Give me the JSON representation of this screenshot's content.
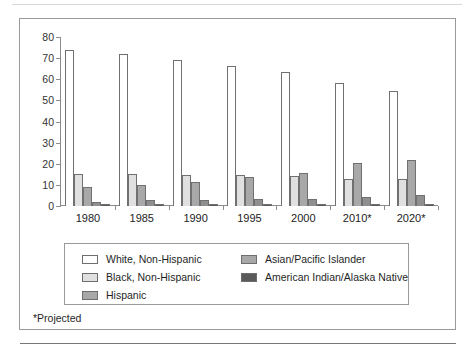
{
  "figure": {
    "footnote": "*Projected"
  },
  "chart_data": {
    "type": "bar",
    "title": "",
    "xlabel": "",
    "ylabel": "",
    "ylim": [
      0,
      80
    ],
    "yticks": [
      0,
      10,
      20,
      30,
      40,
      50,
      60,
      70,
      80
    ],
    "ytick_labels": [
      "0",
      "10",
      "20",
      "30",
      "40",
      "50",
      "60",
      "70",
      "80"
    ],
    "grid": false,
    "legend_position": "below-axes",
    "categories": [
      "1980",
      "1985",
      "1990",
      "1995",
      "2000",
      "2010*",
      "2020*"
    ],
    "series": [
      {
        "name": "White, Non-Hispanic",
        "color": "#ffffff",
        "values": [
          74.0,
          72.0,
          69.0,
          66.5,
          63.5,
          58.0,
          54.5
        ]
      },
      {
        "name": "Black, Non-Hispanic",
        "color": "#e0e0e0",
        "values": [
          15.0,
          15.0,
          14.5,
          14.5,
          14.0,
          13.0,
          13.0
        ]
      },
      {
        "name": "Hispanic",
        "color": "#a8a8a8",
        "values": [
          9.0,
          10.0,
          11.5,
          13.5,
          15.5,
          20.5,
          22.0
        ]
      },
      {
        "name": "Asian/Pacific Islander",
        "color": "#a8a8a8",
        "values": [
          2.0,
          3.0,
          3.0,
          3.5,
          3.5,
          4.5,
          5.0
        ]
      },
      {
        "name": "American Indian/Alaska Native",
        "color": "#5a5a5a",
        "values": [
          1.0,
          1.0,
          1.0,
          1.0,
          1.0,
          1.0,
          1.0
        ]
      }
    ]
  }
}
